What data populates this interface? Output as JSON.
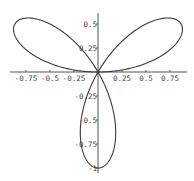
{
  "chart_data": {
    "type": "line",
    "title": "",
    "equation": "r = sin(3*theta)",
    "parametric": {
      "x": "sin(3t)*cos(t)",
      "y": "sin(3t)*sin(t)",
      "t_range": [
        0,
        3.14159
      ]
    },
    "xlabel": "",
    "ylabel": "",
    "xlim": [
      -0.95,
      0.95
    ],
    "ylim": [
      -1.05,
      0.6
    ],
    "grid": false,
    "legend": null,
    "x_ticks": [
      -0.75,
      -0.5,
      -0.25,
      0.25,
      0.5,
      0.75
    ],
    "x_tick_labels": [
      "-0.75",
      "-0.5",
      "-0.25",
      "0.25",
      "0.5",
      "0.75"
    ],
    "y_ticks": [
      0.5,
      0.25,
      -0.25,
      -0.5,
      -0.75,
      -1
    ],
    "y_tick_labels": [
      "0.5",
      "0.25",
      "-0.25",
      "-0.5",
      "-0.75",
      "-1"
    ],
    "petal_tips": [
      {
        "x": 0.866,
        "y": 0.5
      },
      {
        "x": -0.866,
        "y": 0.5
      },
      {
        "x": 0.0,
        "y": -1.0
      }
    ],
    "series": [
      {
        "name": "rose",
        "color": "#3a3a3a"
      }
    ]
  },
  "layout": {
    "origin_px": [
      98,
      72
    ],
    "scale_px": 96,
    "x_axis_px": [
      10,
      187
    ],
    "y_axis_px": [
      13,
      173
    ]
  }
}
